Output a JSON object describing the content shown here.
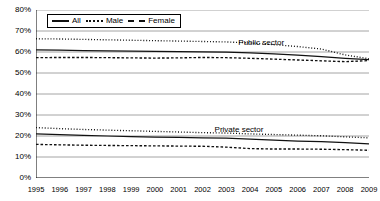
{
  "chart_data": {
    "type": "line",
    "title": "",
    "xlabel": "",
    "ylabel": "",
    "xlim": [
      1995,
      2009
    ],
    "ylim": [
      0,
      80
    ],
    "ytick_suffix": "%",
    "grid": true,
    "legend_position": "top-left",
    "x": [
      1995,
      1996,
      1997,
      1998,
      1999,
      2000,
      2001,
      2002,
      2003,
      2004,
      2005,
      2006,
      2007,
      2008,
      2009
    ],
    "yticks": [
      0,
      10,
      20,
      30,
      40,
      50,
      60,
      70,
      80
    ],
    "ytick_labels": [
      "0%",
      "10%",
      "20%",
      "30%",
      "40%",
      "50%",
      "60%",
      "70%",
      "80%"
    ],
    "xtick_labels": [
      "1995",
      "1996",
      "1997",
      "1998",
      "1999",
      "2000",
      "2001",
      "2002",
      "2003",
      "2004",
      "2005",
      "2006",
      "2007",
      "2008",
      "2009"
    ],
    "annotations": [
      {
        "text": "Public sector",
        "x": 2004.6,
        "y": 64.5
      },
      {
        "text": "Private sector",
        "x": 2003.6,
        "y": 23.0
      }
    ],
    "groups": [
      {
        "name": "Public sector",
        "series": [
          {
            "name": "Male",
            "style": "dotted",
            "values": [
              66.3,
              66.2,
              66.0,
              65.8,
              65.6,
              65.4,
              65.2,
              65.0,
              64.8,
              64.3,
              63.5,
              62.6,
              61.4,
              58.6,
              56.8
            ]
          },
          {
            "name": "All",
            "style": "solid",
            "values": [
              61.0,
              60.9,
              60.7,
              60.5,
              60.4,
              60.3,
              60.2,
              60.1,
              59.9,
              59.6,
              59.1,
              58.5,
              57.8,
              57.0,
              56.4
            ]
          },
          {
            "name": "Female",
            "style": "dashed",
            "values": [
              57.3,
              57.4,
              57.4,
              57.3,
              57.2,
              57.1,
              57.2,
              57.4,
              57.3,
              57.0,
              56.6,
              56.2,
              55.8,
              55.4,
              55.9
            ]
          }
        ]
      },
      {
        "name": "Private sector",
        "series": [
          {
            "name": "Male",
            "style": "dotted",
            "values": [
              24.0,
              23.5,
              23.1,
              22.8,
              22.5,
              22.2,
              21.9,
              21.6,
              21.4,
              21.0,
              20.7,
              20.4,
              20.1,
              19.6,
              19.1
            ]
          },
          {
            "name": "All",
            "style": "solid",
            "values": [
              21.0,
              20.6,
              20.3,
              20.0,
              19.7,
              19.5,
              19.3,
              19.1,
              19.0,
              18.5,
              18.0,
              17.6,
              17.3,
              16.8,
              16.3
            ]
          },
          {
            "name": "Female",
            "style": "dashed",
            "values": [
              16.0,
              15.8,
              15.6,
              15.5,
              15.4,
              15.3,
              15.2,
              15.1,
              14.7,
              14.0,
              13.8,
              13.8,
              13.7,
              13.5,
              13.2
            ]
          }
        ]
      }
    ],
    "legend": [
      {
        "label": "All",
        "style": "solid"
      },
      {
        "label": "Male",
        "style": "dotted"
      },
      {
        "label": "Female",
        "style": "dashed"
      }
    ],
    "colors": {
      "line": "#111111",
      "grid": "#9a9a9a",
      "axis": "#000000"
    }
  }
}
